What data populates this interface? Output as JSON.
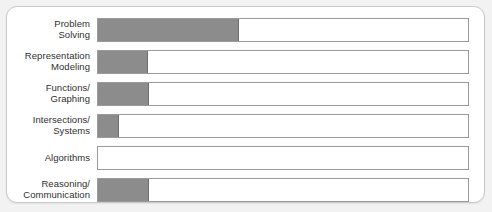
{
  "panel": {
    "background_color": "#ffffff",
    "border_color": "#c9c9c9",
    "page_background": "#f2f2f2"
  },
  "chart_data": {
    "type": "bar",
    "orientation": "horizontal",
    "title": "",
    "subtitle": "",
    "xlabel": "",
    "ylabel": "",
    "grid": false,
    "legend": null,
    "xlim": [
      0,
      100
    ],
    "bar_color": "#8c8c8c",
    "track_color": "#ffffff",
    "track_border_color": "#9a9a9a",
    "categories": [
      "Problem\nSolving",
      "Representation\nModeling",
      "Functions/\nGraphing",
      "Intersections/\nSystems",
      "Algorithms",
      "Reasoning/\nCommunication"
    ],
    "values": [
      38,
      13.5,
      13.7,
      5.6,
      0,
      13.7
    ],
    "rows": [
      {
        "label": "Problem\nSolving",
        "value": 38,
        "pct": "38%"
      },
      {
        "label": "Representation\nModeling",
        "value": 13.5,
        "pct": "13.5%"
      },
      {
        "label": "Functions/\nGraphing",
        "value": 13.7,
        "pct": "13.7%"
      },
      {
        "label": "Intersections/\nSystems",
        "value": 5.6,
        "pct": "5.6%"
      },
      {
        "label": "Algorithms",
        "value": 0,
        "pct": "0%"
      },
      {
        "label": "Reasoning/\nCommunication",
        "value": 13.7,
        "pct": "13.7%"
      }
    ]
  }
}
